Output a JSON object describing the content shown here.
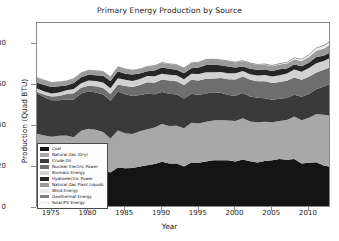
{
  "chart_data": {
    "type": "area",
    "title": "Primary Energy Production by Source",
    "xlabel": "Year",
    "ylabel": "Production (Quad BTU)",
    "xlim": [
      1973,
      2013
    ],
    "ylim": [
      0,
      90
    ],
    "xticks": [
      1975,
      1980,
      1985,
      1990,
      1995,
      2000,
      2005,
      2010
    ],
    "yticks": [
      0,
      20,
      40,
      60,
      80
    ],
    "grid": false,
    "stacked": true,
    "legend_position": "lower left",
    "x": [
      1973,
      1974,
      1975,
      1976,
      1977,
      1978,
      1979,
      1980,
      1981,
      1982,
      1983,
      1984,
      1985,
      1986,
      1987,
      1988,
      1989,
      1990,
      1991,
      1992,
      1993,
      1994,
      1995,
      1996,
      1997,
      1998,
      1999,
      2000,
      2001,
      2002,
      2003,
      2004,
      2005,
      2006,
      2007,
      2008,
      2009,
      2010,
      2011,
      2012,
      2013
    ],
    "series": [
      {
        "name": "Coal",
        "color": "#141414",
        "values": [
          13.99,
          14.07,
          14.99,
          15.65,
          15.76,
          14.91,
          17.54,
          18.6,
          18.38,
          18.64,
          17.25,
          19.72,
          19.33,
          19.51,
          20.14,
          20.74,
          21.36,
          22.49,
          21.64,
          21.63,
          20.25,
          22.11,
          21.98,
          22.68,
          23.21,
          23.19,
          23.19,
          22.62,
          23.55,
          22.73,
          22.09,
          22.85,
          23.19,
          23.79,
          23.49,
          23.85,
          21.62,
          22.04,
          22.21,
          20.68,
          20.0
        ]
      },
      {
        "name": "Natural Gas (Dry)",
        "color": "#a8a8a8",
        "values": [
          22.19,
          21.21,
          19.64,
          19.48,
          19.57,
          19.49,
          20.08,
          19.91,
          19.7,
          18.32,
          16.59,
          18.01,
          16.98,
          16.54,
          17.14,
          17.6,
          17.85,
          18.36,
          18.23,
          18.38,
          18.58,
          19.35,
          19.08,
          19.34,
          19.39,
          19.61,
          19.34,
          19.66,
          20.17,
          19.38,
          19.63,
          19.07,
          18.56,
          18.5,
          19.27,
          20.7,
          21.11,
          21.81,
          23.51,
          24.66,
          24.88
        ]
      },
      {
        "name": "Crude Oil",
        "color": "#3a3a3a",
        "values": [
          19.49,
          18.58,
          17.73,
          17.26,
          17.45,
          18.43,
          18.1,
          18.25,
          18.15,
          18.31,
          18.39,
          18.85,
          18.99,
          18.38,
          17.67,
          17.28,
          16.12,
          15.57,
          15.7,
          15.22,
          14.49,
          14.1,
          13.89,
          13.72,
          13.66,
          13.24,
          12.45,
          12.36,
          12.28,
          12.16,
          11.94,
          11.5,
          10.96,
          10.8,
          10.72,
          10.51,
          11.34,
          11.59,
          11.99,
          13.81,
          15.57
        ]
      },
      {
        "name": "Nuclear Electric Power",
        "color": "#6e6e6e",
        "values": [
          0.91,
          1.27,
          1.9,
          2.11,
          2.7,
          3.02,
          2.78,
          2.74,
          3.01,
          3.13,
          3.2,
          3.55,
          4.08,
          4.47,
          4.91,
          5.59,
          5.6,
          6.1,
          6.42,
          6.48,
          6.52,
          6.84,
          7.08,
          7.09,
          6.68,
          7.16,
          7.61,
          7.86,
          8.03,
          8.14,
          7.96,
          8.22,
          8.16,
          8.21,
          8.46,
          8.43,
          8.35,
          8.43,
          8.26,
          8.06,
          8.24
        ]
      },
      {
        "name": "Biomass Energy",
        "color": "#d2d2d2",
        "values": [
          1.53,
          1.54,
          1.5,
          1.71,
          1.84,
          2.04,
          2.15,
          2.48,
          2.59,
          2.66,
          2.83,
          2.97,
          3.02,
          2.93,
          2.93,
          3.02,
          3.16,
          2.74,
          2.78,
          2.9,
          2.79,
          2.89,
          3.1,
          3.16,
          3.1,
          2.93,
          2.97,
          3.01,
          2.62,
          2.7,
          2.82,
          3.02,
          3.12,
          3.27,
          3.5,
          3.83,
          3.88,
          4.29,
          4.43,
          4.27,
          4.58
        ]
      },
      {
        "name": "Hydroelectric Power",
        "color": "#262626",
        "values": [
          2.86,
          3.18,
          3.15,
          2.98,
          2.33,
          2.94,
          2.93,
          2.9,
          2.75,
          3.27,
          3.53,
          3.39,
          2.97,
          3.07,
          2.63,
          2.33,
          2.84,
          3.05,
          3.02,
          2.62,
          2.89,
          2.68,
          3.21,
          3.59,
          3.64,
          3.3,
          3.27,
          2.81,
          2.24,
          2.69,
          2.83,
          2.69,
          2.7,
          2.87,
          2.45,
          2.51,
          2.67,
          2.54,
          3.1,
          2.63,
          2.56
        ]
      },
      {
        "name": "Natural Gas Plant Liquids",
        "color": "#9a9a9a",
        "values": [
          2.57,
          2.47,
          2.37,
          2.33,
          2.33,
          2.25,
          2.29,
          2.25,
          2.31,
          2.19,
          2.18,
          2.27,
          2.24,
          2.15,
          2.22,
          2.26,
          2.16,
          2.18,
          2.3,
          2.36,
          2.41,
          2.39,
          2.44,
          2.53,
          2.51,
          2.42,
          2.53,
          2.61,
          2.55,
          2.56,
          2.35,
          2.47,
          2.33,
          2.36,
          2.41,
          2.42,
          2.57,
          2.78,
          3.04,
          3.42,
          3.78
        ]
      },
      {
        "name": "Wind Energy",
        "color": "#ececec",
        "values": [
          0.0,
          0.0,
          0.0,
          0.0,
          0.0,
          0.0,
          0.0,
          0.0,
          0.0,
          0.0,
          0.0,
          0.0,
          0.01,
          0.01,
          0.01,
          0.01,
          0.02,
          0.03,
          0.03,
          0.03,
          0.03,
          0.04,
          0.03,
          0.03,
          0.03,
          0.03,
          0.05,
          0.06,
          0.07,
          0.11,
          0.12,
          0.14,
          0.18,
          0.26,
          0.34,
          0.55,
          0.72,
          0.92,
          1.17,
          1.34,
          1.6
        ]
      },
      {
        "name": "Geothermal Energy",
        "color": "#808080",
        "values": [
          0.04,
          0.05,
          0.07,
          0.08,
          0.08,
          0.06,
          0.08,
          0.11,
          0.12,
          0.1,
          0.13,
          0.16,
          0.2,
          0.22,
          0.23,
          0.22,
          0.32,
          0.34,
          0.35,
          0.35,
          0.36,
          0.34,
          0.29,
          0.32,
          0.33,
          0.33,
          0.33,
          0.32,
          0.31,
          0.33,
          0.33,
          0.34,
          0.34,
          0.34,
          0.35,
          0.36,
          0.37,
          0.38,
          0.39,
          0.4,
          0.41
        ]
      },
      {
        "name": "Solar/PV Energy",
        "color": "#f2f2f2",
        "values": [
          0.0,
          0.0,
          0.0,
          0.0,
          0.0,
          0.0,
          0.0,
          0.0,
          0.0,
          0.0,
          0.0,
          0.0,
          0.0,
          0.0,
          0.0,
          0.0,
          0.0,
          0.06,
          0.06,
          0.06,
          0.07,
          0.07,
          0.07,
          0.07,
          0.07,
          0.07,
          0.07,
          0.07,
          0.07,
          0.06,
          0.06,
          0.06,
          0.06,
          0.07,
          0.08,
          0.09,
          0.1,
          0.13,
          0.16,
          0.23,
          0.31
        ]
      }
    ]
  }
}
